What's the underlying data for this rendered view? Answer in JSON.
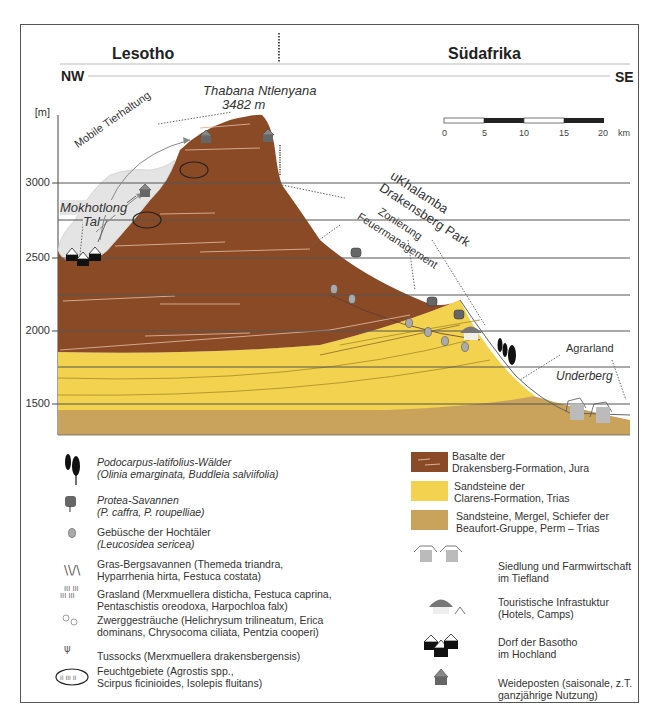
{
  "header": {
    "left_region": "Lesotho",
    "right_region": "Südafrika",
    "left_direction": "NW",
    "right_direction": "SE"
  },
  "axis": {
    "unit": "[m]",
    "ticks": [
      "3000",
      "2500",
      "2000",
      "1500"
    ]
  },
  "scale_bar": {
    "labels": [
      "0",
      "5",
      "10",
      "15",
      "20"
    ],
    "unit": "km"
  },
  "annotations": {
    "peak_name": "Thabana Ntlenyana",
    "peak_height": "3482 m",
    "mobile_herding": "Mobile Tierhaltung",
    "valley_1": "Mokhotlong",
    "valley_2": "Tal",
    "park_1": "uKhalamba",
    "park_2": "Drakensberg Park",
    "fire_1": "Zonierung",
    "fire_2": "Feuermanagement",
    "farmland": "Agrarland",
    "town": "Underberg"
  },
  "legend_vegetation": [
    {
      "icon": "podocarpus-tree-icon",
      "line1": "Podocarpus-latifolius-Wälder",
      "line2": "(Olinia emarginata, Buddleia salviifolia)"
    },
    {
      "icon": "protea-icon",
      "line1": "Protea-Savannen",
      "line2": "(P. caffra, P. roupelliae)"
    },
    {
      "icon": "shrub-icon",
      "line1": "Gebüsche der Hochtäler",
      "line2": "(Leucosidea sericea)"
    },
    {
      "icon": "grass-savanna-icon",
      "line1": "Gras-Bergsavannen (Themeda triandra,",
      "line2": "Hyparrhenia hirta, Festuca costata)"
    },
    {
      "icon": "grassland-icon",
      "line1": "Grasland (Merxmuellera disticha, Festuca caprina,",
      "line2": "Pentaschistis oreodoxa, Harpochloa falx)"
    },
    {
      "icon": "dwarf-shrub-icon",
      "line1": "Zwerggesträuche (Helichrysum trilineatum, Erica",
      "line2": "dominans, Chrysocoma ciliata, Pentzia cooperi)"
    },
    {
      "icon": "tussock-icon",
      "line1": "Tussocks (Merxmuellera drakensbergensis)",
      "line2": ""
    },
    {
      "icon": "wetland-icon",
      "line1": "Feuchtgebiete (Agrostis spp.,",
      "line2": "Scirpus ficinioides, Isolepis fluitans)"
    }
  ],
  "legend_geology": [
    {
      "color": "#8b4a26",
      "line1": "Basalte der",
      "line2": "Drakensberg-Formation, Jura"
    },
    {
      "color": "#f2d24e",
      "line1": "Sandsteine der",
      "line2": "Clarens-Formation, Trias"
    },
    {
      "color": "#c9a35c",
      "line1": "Sandsteine, Mergel, Schiefer der",
      "line2": "Beaufort-Gruppe, Perm – Trias"
    }
  ],
  "legend_settlement": [
    {
      "icon": "farm-settlement-icon",
      "line1": "Siedlung und Farmwirtschaft",
      "line2": "im Tiefland"
    },
    {
      "icon": "tourism-icon",
      "line1": "Touristische Infrastuktur",
      "line2": "(Hotels, Camps)"
    },
    {
      "icon": "basotho-village-icon",
      "line1": "Dorf der Basotho",
      "line2": "im Hochland"
    },
    {
      "icon": "cattle-post-icon",
      "line1": "Weideposten (saisonale, z.T.",
      "line2": "ganzjährige Nutzung)"
    }
  ],
  "colors": {
    "basalt": "#8b4a26",
    "clarens": "#f2d24e",
    "beaufort": "#c9a35c",
    "valley": "#e4e4e4",
    "line": "#333333"
  }
}
